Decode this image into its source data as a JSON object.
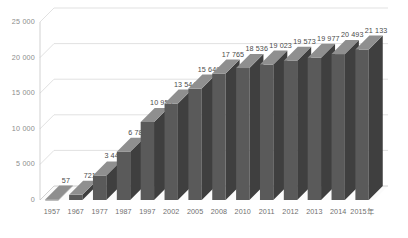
{
  "chart_data": {
    "type": "bar",
    "title": "",
    "subtitle": "",
    "xlabel": "",
    "ylabel": "",
    "categories": [
      "1957",
      "1967",
      "1977",
      "1987",
      "1997",
      "2002",
      "2005",
      "2008",
      "2010",
      "2011",
      "2012",
      "2013",
      "2014",
      "2015年"
    ],
    "values": [
      57,
      721,
      3443,
      6789,
      10959,
      13544,
      15649,
      17765,
      18536,
      19023,
      19573,
      19977,
      20493,
      21133
    ],
    "value_labels": [
      "57",
      "721",
      "3 443",
      "6 789",
      "10 959",
      "13 544",
      "15 649",
      "17 765",
      "18 536",
      "19 023",
      "19 573",
      "19 977",
      "20 493",
      "21 133"
    ],
    "ylim": [
      0,
      25000
    ],
    "yticks": [
      0,
      5000,
      10000,
      15000,
      20000,
      25000
    ],
    "ytick_labels": [
      "0",
      "5 000",
      "10 000",
      "15 000",
      "20 000",
      "25 000"
    ],
    "grid": true,
    "legend": null,
    "style": "3d-column",
    "bar_color": "#5a5a5a",
    "bar_top_color": "#8f8f8f",
    "bar_side_color": "#3f3f3f",
    "gridline_color": "#d4d4d4",
    "background": "#ffffff"
  }
}
